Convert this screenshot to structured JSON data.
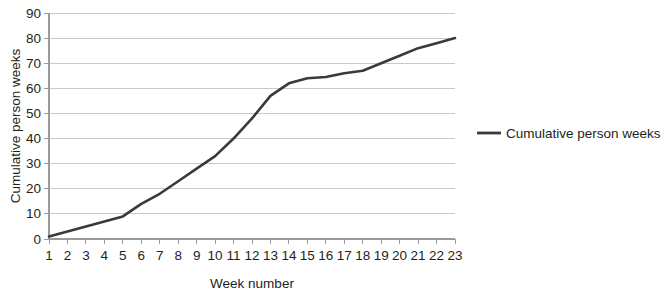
{
  "chart_data": {
    "type": "line",
    "title": "",
    "xlabel": "Week number",
    "ylabel": "Cumulative person weeks",
    "x": [
      1,
      2,
      3,
      4,
      5,
      6,
      7,
      8,
      9,
      10,
      11,
      12,
      13,
      14,
      15,
      16,
      17,
      18,
      19,
      20,
      21,
      22,
      23
    ],
    "categories": [
      "1",
      "2",
      "3",
      "4",
      "5",
      "6",
      "7",
      "8",
      "9",
      "10",
      "11",
      "12",
      "13",
      "14",
      "15",
      "16",
      "17",
      "18",
      "19",
      "20",
      "21",
      "22",
      "23"
    ],
    "series": [
      {
        "name": "Cumulative person weeks",
        "color": "#3a3a3a",
        "values": [
          1,
          3,
          5,
          7,
          9,
          14,
          18,
          23,
          28,
          33,
          40,
          48,
          57,
          62,
          64,
          64.5,
          66,
          67,
          70,
          73,
          76,
          78,
          80
        ]
      }
    ],
    "xlim": [
      1,
      23
    ],
    "ylim": [
      0,
      90
    ],
    "yticks": [
      0,
      10,
      20,
      30,
      40,
      50,
      60,
      70,
      80,
      90
    ],
    "ytick_labels": [
      "0",
      "10",
      "20",
      "30",
      "40",
      "50",
      "60",
      "70",
      "80",
      "90"
    ],
    "grid": true,
    "grid_axis": "y",
    "legend_position": "right",
    "legend_entries": [
      "Cumulative person weeks"
    ]
  },
  "axes": {
    "y_title": "Cumulative person weeks",
    "x_title": "Week number"
  },
  "legend": {
    "items": [
      {
        "label": "Cumulative person weeks",
        "color": "#3a3a3a"
      }
    ]
  },
  "colors": {
    "line": "#3a3a3a",
    "grid": "#c9c9c9",
    "axis": "#9a9a9a",
    "text": "#231f20",
    "background": "#ffffff"
  }
}
